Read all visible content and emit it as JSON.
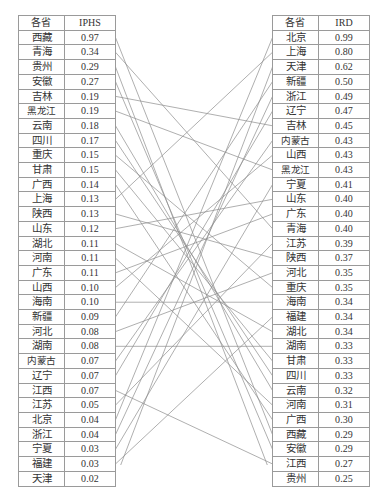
{
  "figure": {
    "type": "paired-rank-table-with-connector-lines",
    "line_color": "#8c8c8c",
    "border_color": "#9a9a9a",
    "background": "#ffffff"
  },
  "left_table": {
    "name": "IPHS ranking table",
    "headers": [
      "各省",
      "IPHS"
    ],
    "rows": [
      {
        "province": "西藏",
        "value": "0.97"
      },
      {
        "province": "青海",
        "value": "0.34"
      },
      {
        "province": "贵州",
        "value": "0.29"
      },
      {
        "province": "安徽",
        "value": "0.27"
      },
      {
        "province": "吉林",
        "value": "0.19"
      },
      {
        "province": "黑龙江",
        "value": "0.19"
      },
      {
        "province": "云南",
        "value": "0.18"
      },
      {
        "province": "四川",
        "value": "0.17"
      },
      {
        "province": "重庆",
        "value": "0.15"
      },
      {
        "province": "甘肃",
        "value": "0.15"
      },
      {
        "province": "广西",
        "value": "0.14"
      },
      {
        "province": "上海",
        "value": "0.13"
      },
      {
        "province": "陕西",
        "value": "0.13"
      },
      {
        "province": "山东",
        "value": "0.12"
      },
      {
        "province": "湖北",
        "value": "0.11"
      },
      {
        "province": "河南",
        "value": "0.11"
      },
      {
        "province": "广东",
        "value": "0.11"
      },
      {
        "province": "山西",
        "value": "0.10"
      },
      {
        "province": "海南",
        "value": "0.10"
      },
      {
        "province": "新疆",
        "value": "0.09"
      },
      {
        "province": "河北",
        "value": "0.08"
      },
      {
        "province": "湖南",
        "value": "0.08"
      },
      {
        "province": "内蒙古",
        "value": "0.07"
      },
      {
        "province": "辽宁",
        "value": "0.07"
      },
      {
        "province": "江西",
        "value": "0.07"
      },
      {
        "province": "江苏",
        "value": "0.05"
      },
      {
        "province": "北京",
        "value": "0.04"
      },
      {
        "province": "浙江",
        "value": "0.04"
      },
      {
        "province": "宁夏",
        "value": "0.03"
      },
      {
        "province": "福建",
        "value": "0.03"
      },
      {
        "province": "天津",
        "value": "0.02"
      }
    ]
  },
  "right_table": {
    "name": "IRD ranking table",
    "headers": [
      "各省",
      "IRD"
    ],
    "rows": [
      {
        "province": "北京",
        "value": "0.99"
      },
      {
        "province": "上海",
        "value": "0.80"
      },
      {
        "province": "天津",
        "value": "0.62"
      },
      {
        "province": "新疆",
        "value": "0.50"
      },
      {
        "province": "浙江",
        "value": "0.49"
      },
      {
        "province": "辽宁",
        "value": "0.47"
      },
      {
        "province": "吉林",
        "value": "0.45"
      },
      {
        "province": "内蒙古",
        "value": "0.43"
      },
      {
        "province": "山西",
        "value": "0.43"
      },
      {
        "province": "黑龙江",
        "value": "0.43"
      },
      {
        "province": "宁夏",
        "value": "0.41"
      },
      {
        "province": "山东",
        "value": "0.40"
      },
      {
        "province": "广东",
        "value": "0.40"
      },
      {
        "province": "青海",
        "value": "0.40"
      },
      {
        "province": "江苏",
        "value": "0.39"
      },
      {
        "province": "陕西",
        "value": "0.37"
      },
      {
        "province": "河北",
        "value": "0.35"
      },
      {
        "province": "重庆",
        "value": "0.35"
      },
      {
        "province": "海南",
        "value": "0.34"
      },
      {
        "province": "福建",
        "value": "0.34"
      },
      {
        "province": "湖北",
        "value": "0.34"
      },
      {
        "province": "湖南",
        "value": "0.33"
      },
      {
        "province": "甘肃",
        "value": "0.33"
      },
      {
        "province": "四川",
        "value": "0.33"
      },
      {
        "province": "云南",
        "value": "0.32"
      },
      {
        "province": "河南",
        "value": "0.31"
      },
      {
        "province": "广西",
        "value": "0.30"
      },
      {
        "province": "西藏",
        "value": "0.29"
      },
      {
        "province": "安徽",
        "value": "0.29"
      },
      {
        "province": "江西",
        "value": "0.27"
      },
      {
        "province": "贵州",
        "value": "0.25"
      }
    ]
  },
  "chart_data": {
    "type": "table",
    "title": "",
    "series": [
      {
        "name": "IPHS",
        "categories": [
          "西藏",
          "青海",
          "贵州",
          "安徽",
          "吉林",
          "黑龙江",
          "云南",
          "四川",
          "重庆",
          "甘肃",
          "广西",
          "上海",
          "陕西",
          "山东",
          "湖北",
          "河南",
          "广东",
          "山西",
          "海南",
          "新疆",
          "河北",
          "湖南",
          "内蒙古",
          "辽宁",
          "江西",
          "江苏",
          "北京",
          "浙江",
          "宁夏",
          "福建",
          "天津"
        ],
        "values": [
          0.97,
          0.34,
          0.29,
          0.27,
          0.19,
          0.19,
          0.18,
          0.17,
          0.15,
          0.15,
          0.14,
          0.13,
          0.13,
          0.12,
          0.11,
          0.11,
          0.11,
          0.1,
          0.1,
          0.09,
          0.08,
          0.08,
          0.07,
          0.07,
          0.07,
          0.05,
          0.04,
          0.04,
          0.03,
          0.03,
          0.02
        ]
      },
      {
        "name": "IRD",
        "categories": [
          "北京",
          "上海",
          "天津",
          "新疆",
          "浙江",
          "辽宁",
          "吉林",
          "内蒙古",
          "山西",
          "黑龙江",
          "宁夏",
          "山东",
          "广东",
          "青海",
          "江苏",
          "陕西",
          "河北",
          "重庆",
          "海南",
          "福建",
          "湖北",
          "湖南",
          "甘肃",
          "四川",
          "云南",
          "河南",
          "广西",
          "西藏",
          "安徽",
          "江西",
          "贵州"
        ],
        "values": [
          0.99,
          0.8,
          0.62,
          0.5,
          0.49,
          0.47,
          0.45,
          0.43,
          0.43,
          0.43,
          0.41,
          0.4,
          0.4,
          0.4,
          0.39,
          0.37,
          0.35,
          0.35,
          0.34,
          0.34,
          0.34,
          0.33,
          0.33,
          0.33,
          0.32,
          0.31,
          0.3,
          0.29,
          0.29,
          0.27,
          0.25
        ]
      }
    ],
    "xlabel": "",
    "ylabel": "",
    "legend": [
      "IPHS",
      "IRD"
    ]
  }
}
